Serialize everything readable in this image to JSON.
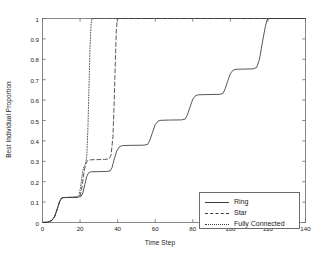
{
  "chart_data": {
    "type": "line",
    "title": "",
    "xlabel": "Time Step",
    "ylabel": "Best Individual Proportion",
    "xlim": [
      0,
      140
    ],
    "ylim": [
      0,
      1
    ],
    "xticks": [
      0,
      20,
      40,
      60,
      80,
      100,
      120,
      140
    ],
    "xtick_labels": [
      "0",
      "20",
      "40",
      "60",
      "80",
      "100",
      "120",
      "140"
    ],
    "yticks": [
      0,
      0.1,
      0.2,
      0.3,
      0.4,
      0.5,
      0.6,
      0.7,
      0.8,
      0.9,
      1
    ],
    "ytick_labels": [
      "0",
      "0.1",
      "0.2",
      "0.3",
      "0.4",
      "0.5",
      "0.6",
      "0.7",
      "0.8",
      "0.9",
      "1"
    ],
    "grid": false,
    "legend_position": "lower right",
    "line_color": "#3a3a3a",
    "axis_color": "#6b6b6b",
    "series": [
      {
        "name": "Ring",
        "style": "solid",
        "points": [
          [
            0,
            0.0
          ],
          [
            3,
            0.002
          ],
          [
            5,
            0.01
          ],
          [
            6.5,
            0.03
          ],
          [
            8,
            0.07
          ],
          [
            9,
            0.1
          ],
          [
            10,
            0.118
          ],
          [
            11,
            0.122
          ],
          [
            14,
            0.123
          ],
          [
            19,
            0.124
          ],
          [
            20.5,
            0.128
          ],
          [
            21.5,
            0.145
          ],
          [
            22.5,
            0.185
          ],
          [
            23.5,
            0.225
          ],
          [
            24.5,
            0.243
          ],
          [
            25.5,
            0.248
          ],
          [
            28,
            0.249
          ],
          [
            34,
            0.25
          ],
          [
            36,
            0.253
          ],
          [
            37,
            0.268
          ],
          [
            38,
            0.305
          ],
          [
            39.5,
            0.35
          ],
          [
            41,
            0.372
          ],
          [
            42.5,
            0.377
          ],
          [
            46,
            0.378
          ],
          [
            54,
            0.379
          ],
          [
            56,
            0.383
          ],
          [
            57,
            0.4
          ],
          [
            58.5,
            0.44
          ],
          [
            60,
            0.48
          ],
          [
            61.5,
            0.497
          ],
          [
            63,
            0.501
          ],
          [
            67,
            0.502
          ],
          [
            74,
            0.503
          ],
          [
            76,
            0.507
          ],
          [
            77,
            0.525
          ],
          [
            78.5,
            0.565
          ],
          [
            80,
            0.605
          ],
          [
            81.5,
            0.622
          ],
          [
            83,
            0.626
          ],
          [
            87,
            0.627
          ],
          [
            94,
            0.628
          ],
          [
            96,
            0.632
          ],
          [
            97,
            0.65
          ],
          [
            98.5,
            0.69
          ],
          [
            100,
            0.73
          ],
          [
            101.5,
            0.747
          ],
          [
            103,
            0.751
          ],
          [
            107,
            0.752
          ],
          [
            112,
            0.753
          ],
          [
            114,
            0.76
          ],
          [
            115.5,
            0.8
          ],
          [
            117,
            0.88
          ],
          [
            118.5,
            0.955
          ],
          [
            119.5,
            0.993
          ],
          [
            120.5,
            1.0
          ],
          [
            140,
            1.0
          ]
        ]
      },
      {
        "name": "Star",
        "style": "dashed",
        "points": [
          [
            0,
            0.0
          ],
          [
            3,
            0.002
          ],
          [
            5,
            0.01
          ],
          [
            6.5,
            0.03
          ],
          [
            8,
            0.07
          ],
          [
            9,
            0.1
          ],
          [
            10,
            0.118
          ],
          [
            11,
            0.122
          ],
          [
            14,
            0.123
          ],
          [
            19,
            0.124
          ],
          [
            20,
            0.13
          ],
          [
            20.8,
            0.16
          ],
          [
            21.6,
            0.215
          ],
          [
            22.4,
            0.262
          ],
          [
            23.2,
            0.292
          ],
          [
            24,
            0.303
          ],
          [
            25,
            0.307
          ],
          [
            28,
            0.308
          ],
          [
            33,
            0.309
          ],
          [
            35.5,
            0.312
          ],
          [
            36.5,
            0.33
          ],
          [
            37.5,
            0.42
          ],
          [
            38.2,
            0.6
          ],
          [
            38.8,
            0.8
          ],
          [
            39.3,
            0.94
          ],
          [
            39.8,
            0.995
          ],
          [
            40.2,
            1.0
          ],
          [
            140,
            1.0
          ]
        ]
      },
      {
        "name": "Fully Connected",
        "style": "dotted",
        "points": [
          [
            0,
            0.0
          ],
          [
            3,
            0.002
          ],
          [
            5,
            0.01
          ],
          [
            6.5,
            0.03
          ],
          [
            8,
            0.07
          ],
          [
            9,
            0.1
          ],
          [
            10,
            0.118
          ],
          [
            11,
            0.122
          ],
          [
            14,
            0.123
          ],
          [
            18.5,
            0.124
          ],
          [
            19.5,
            0.135
          ],
          [
            20.3,
            0.175
          ],
          [
            21,
            0.225
          ],
          [
            21.7,
            0.262
          ],
          [
            22.3,
            0.278
          ],
          [
            22.9,
            0.284
          ],
          [
            23.6,
            0.33
          ],
          [
            24.2,
            0.47
          ],
          [
            24.8,
            0.68
          ],
          [
            25.3,
            0.86
          ],
          [
            25.8,
            0.965
          ],
          [
            26.3,
            1.0
          ],
          [
            140,
            1.0
          ]
        ]
      }
    ]
  }
}
